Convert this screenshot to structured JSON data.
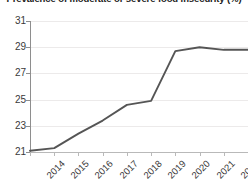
{
  "chart_data": {
    "type": "line",
    "title": "Prevalence of moderate or severe food insecurity (%)",
    "xlabel": "",
    "ylabel": "",
    "categories": [
      "2014",
      "2015",
      "2016",
      "2017",
      "2018",
      "2019",
      "2020",
      "2021",
      "2022",
      "2023"
    ],
    "x": [
      2014,
      2015,
      2016,
      2017,
      2018,
      2019,
      2020,
      2021,
      2022,
      2023
    ],
    "series": [
      {
        "name": "Prevalence of moderate or severe food insecurity (%)",
        "values": [
          21.1,
          21.3,
          22.4,
          23.4,
          24.6,
          24.9,
          28.7,
          29.0,
          28.8,
          28.8
        ],
        "color": "#555555"
      }
    ],
    "ylim": [
      21,
      31
    ],
    "xlim": [
      2014,
      2023
    ],
    "yticks": [
      21,
      23,
      25,
      27,
      29,
      31
    ],
    "ytick_labels": [
      "21",
      "23",
      "25",
      "27",
      "29",
      "31"
    ],
    "grid": true,
    "grid_axis": "y",
    "legend": false,
    "legend_position": "none",
    "xtick_rotation": -45
  },
  "colors": {
    "line": "#555555",
    "gridline": "#eceaea",
    "axis": "#8e8e8e",
    "x_axis": "#b9b9b9",
    "tick_text": "#3a3a3a",
    "title_text": "#1a1a1a",
    "background": "#ffffff"
  }
}
